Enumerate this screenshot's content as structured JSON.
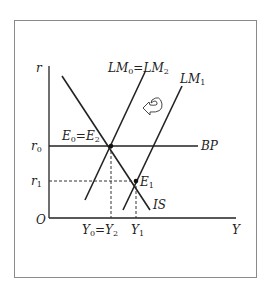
{
  "diagram": {
    "type": "IS-LM-BP",
    "axes": {
      "y_label": "r",
      "x_label": "Y",
      "origin_label": "O"
    },
    "curves": [
      {
        "id": "IS",
        "label": "IS"
      },
      {
        "id": "LM0",
        "label_main": "LM",
        "label_sub0": "0",
        "label_eq": "=LM",
        "label_sub2": "2"
      },
      {
        "id": "LM1",
        "label_main": "LM",
        "label_sub": "1"
      },
      {
        "id": "BP",
        "label": "BP"
      }
    ],
    "points": {
      "E0": {
        "main": "E",
        "sub0": "0",
        "eq": "=E",
        "sub2": "2"
      },
      "E1": {
        "main": "E",
        "sub": "1"
      }
    },
    "ticks": {
      "r0": {
        "main": "r",
        "sub": "0"
      },
      "r1": {
        "main": "r",
        "sub": "1"
      },
      "Y0": {
        "main": "Y",
        "sub0": "0",
        "eq": "=Y",
        "sub2": "2"
      },
      "Y1": {
        "main": "Y",
        "sub": "1"
      }
    },
    "annotation": "curved arrow indicating LM1 shifting back to LM0"
  }
}
